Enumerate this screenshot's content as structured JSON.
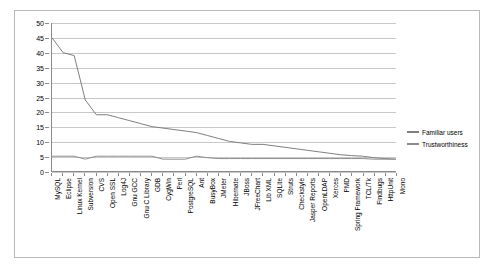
{
  "chart_data": {
    "type": "line",
    "title": "",
    "xlabel": "",
    "ylabel": "",
    "ylim": [
      0,
      50
    ],
    "ytick_step": 5,
    "grid": true,
    "legend_position": "right",
    "yticks": [
      "50",
      "45",
      "40",
      "35",
      "30",
      "25",
      "20",
      "15",
      "10",
      "5",
      "0"
    ],
    "categories": [
      "MySQL",
      "Eclipse",
      "Linux Kernel",
      "Subversion",
      "CVS",
      "Open SSL",
      "Log4J",
      "Gnu GCC",
      "Gnu C Library",
      "GDB",
      "CygWin",
      "Perl",
      "PostgreSQL",
      "Ant",
      "BusyBox",
      "JMeter",
      "Hibernate",
      "JBoss",
      "JFreeChart",
      "Lib XML",
      "SQLite",
      "Struts",
      "Checkstyle",
      "Jasper Reports",
      "OpenLDAP",
      "Xerces",
      "PMD",
      "Spring Framework",
      "TCL/Tk",
      "Findbugs",
      "HttpUnit",
      "Mono"
    ],
    "series": [
      {
        "name": "Familiar users",
        "color": "#7f7f7f",
        "values": [
          45,
          40,
          39,
          24,
          19,
          19,
          18,
          17,
          16,
          15,
          14.5,
          14,
          13.5,
          13,
          12,
          11,
          10,
          9.5,
          9,
          9,
          8.5,
          8,
          7.5,
          7,
          6.5,
          6,
          5.5,
          5.2,
          5,
          4.5,
          4.2,
          4
        ]
      },
      {
        "name": "Trustworthiness",
        "color": "#8c8c8c",
        "values": [
          5,
          5,
          5,
          4,
          5,
          5,
          5,
          5,
          5,
          5,
          4,
          4,
          4,
          5,
          4.5,
          4.2,
          4.2,
          4.2,
          4.2,
          4.2,
          4.2,
          4.2,
          4.2,
          4.2,
          4.2,
          4.2,
          4.2,
          4.2,
          4.2,
          4,
          4,
          4
        ]
      }
    ]
  },
  "legend": {
    "items": [
      {
        "label": "Familiar users"
      },
      {
        "label": "Trustworthiness"
      }
    ]
  }
}
